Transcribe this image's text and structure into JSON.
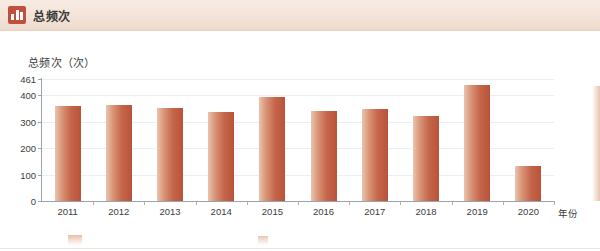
{
  "header": {
    "title": "总频次",
    "icon": "bar-chart-icon"
  },
  "chart_data": {
    "type": "bar",
    "title": "总频次（次）",
    "xlabel": "年份",
    "ylabel": "",
    "categories": [
      "2011",
      "2012",
      "2013",
      "2014",
      "2015",
      "2016",
      "2017",
      "2018",
      "2019",
      "2020"
    ],
    "values": [
      358,
      363,
      350,
      337,
      394,
      341,
      348,
      320,
      438,
      133
    ],
    "ylim": [
      0,
      461
    ],
    "yticks": [
      0,
      100,
      200,
      300,
      400,
      461
    ],
    "ytick_labels": [
      "0",
      "100",
      "200",
      "300",
      "400",
      "461"
    ],
    "grid": true,
    "legend": null,
    "bar_color": "#c4654a"
  }
}
